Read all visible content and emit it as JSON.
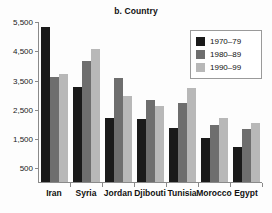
{
  "chart_data": {
    "type": "bar",
    "title": "b. Country",
    "xlabel": "",
    "ylabel": "",
    "ylim": [
      0,
      5500
    ],
    "yticks": [
      500,
      1500,
      2500,
      3500,
      4500,
      5500
    ],
    "ytick_labels": [
      "500",
      "1,500",
      "2,500",
      "3,500",
      "4,500",
      "5,500"
    ],
    "grid": false,
    "legend_position": "top-right",
    "categories": [
      "Iran",
      "Syria",
      "Jordan",
      "Djibouti",
      "Tunisia",
      "Morocco",
      "Egypt"
    ],
    "series": [
      {
        "name": "1970–79",
        "color": "#1a1a1a",
        "values": [
          5300,
          3250,
          2200,
          2150,
          1850,
          1500,
          1200
        ]
      },
      {
        "name": "1980–89",
        "color": "#6e6e6e",
        "values": [
          3600,
          4150,
          3550,
          2800,
          2700,
          1950,
          1800
        ]
      },
      {
        "name": "1990–99",
        "color": "#b8b8b8",
        "values": [
          3700,
          4550,
          2950,
          2600,
          3200,
          2200,
          2000
        ]
      }
    ]
  },
  "colors": {
    "series_1970_79": "#1a1a1a",
    "series_1980_89": "#6e6e6e",
    "series_1990_99": "#b8b8b8",
    "axis": "#8a8a8a",
    "background": "#fdfdfd",
    "text": "#111111"
  }
}
